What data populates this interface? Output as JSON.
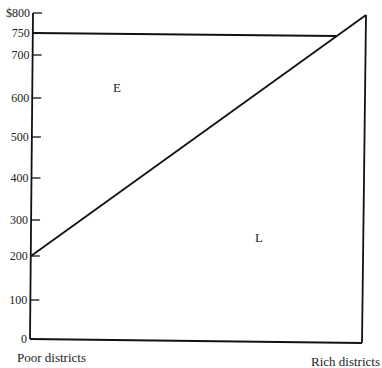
{
  "chart_data": {
    "type": "line",
    "title": "",
    "xlabel": "",
    "ylabel": "",
    "ylim": [
      0,
      800
    ],
    "y_ticks": [
      {
        "value": 800,
        "label": "$800"
      },
      {
        "value": 750,
        "label": "750"
      },
      {
        "value": 700,
        "label": "700"
      },
      {
        "value": 600,
        "label": "600"
      },
      {
        "value": 500,
        "label": "500"
      },
      {
        "value": 400,
        "label": "400"
      },
      {
        "value": 300,
        "label": "300"
      },
      {
        "value": 200,
        "label": "200"
      },
      {
        "value": 100,
        "label": "100"
      },
      {
        "value": 0,
        "label": "0"
      }
    ],
    "x_categories": [
      "Poor districts",
      "Rich districts"
    ],
    "series": [
      {
        "name": "E",
        "description": "flat level line",
        "points": [
          {
            "x": 0,
            "y": 750
          },
          {
            "x": 0.92,
            "y": 750
          }
        ]
      },
      {
        "name": "diagonal",
        "points": [
          {
            "x": 0,
            "y": 200
          },
          {
            "x": 1,
            "y": 800
          }
        ]
      },
      {
        "name": "right-edge",
        "points": [
          {
            "x": 1,
            "y": 800
          },
          {
            "x": 1,
            "y": 0
          }
        ]
      },
      {
        "name": "baseline",
        "points": [
          {
            "x": 0,
            "y": 0
          },
          {
            "x": 1,
            "y": 0
          }
        ]
      }
    ],
    "annotations": [
      {
        "text": "E",
        "x": 0.27,
        "y": 640
      },
      {
        "text": "L",
        "x": 0.69,
        "y": 270
      }
    ],
    "grid": false,
    "legend": "none"
  }
}
